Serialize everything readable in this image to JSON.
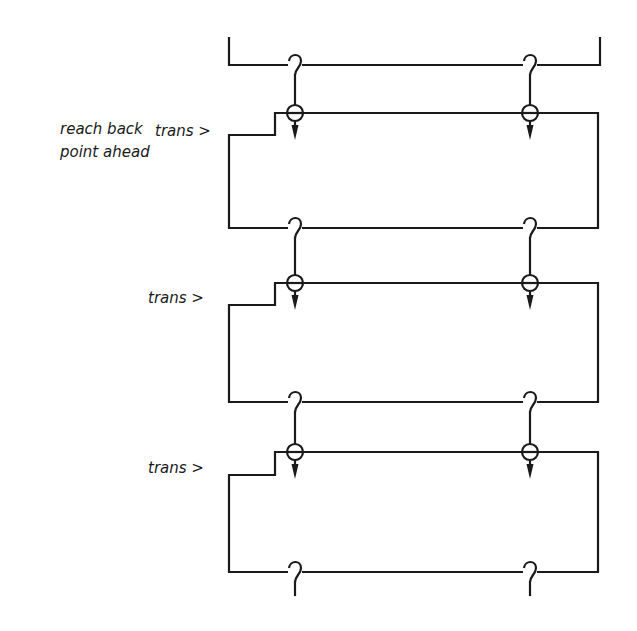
{
  "diagram": {
    "side_label": {
      "line1": "reach back",
      "line2": "point ahead"
    },
    "sections": [
      {
        "label": "trans >",
        "top_y": 113,
        "bottom_y": 228,
        "label_y": 132
      },
      {
        "label": "trans >",
        "top_y": 283,
        "bottom_y": 402,
        "label_y": 300
      },
      {
        "label": "trans >",
        "top_y": 452,
        "bottom_y": 572,
        "label_y": 470
      }
    ],
    "columns_x": [
      295,
      530
    ],
    "stroke_color": "#1a1a1a",
    "background": "#ffffff"
  }
}
